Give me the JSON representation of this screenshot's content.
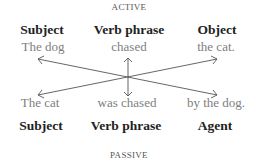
{
  "diagram": {
    "top_label": "ACTIVE",
    "bottom_label": "PASSIVE",
    "active": {
      "headings": [
        "Subject",
        "Verb phrase",
        "Object"
      ],
      "phrases": [
        "The dog",
        "chased",
        "the cat."
      ]
    },
    "passive": {
      "phrases": [
        "The cat",
        "was chased",
        "by the dog."
      ],
      "headings": [
        "Subject",
        "Verb phrase",
        "Agent"
      ]
    },
    "arrows": [
      {
        "from": "Object (active)",
        "to": "Subject (passive)"
      },
      {
        "from": "Subject (active)",
        "to": "Agent (passive)"
      },
      {
        "from": "Verb phrase (active)",
        "to": "Verb phrase (passive)",
        "bidirectional": true
      }
    ],
    "colors": {
      "heading": "#222222",
      "phrase": "#808080",
      "arrow": "#555555"
    }
  }
}
